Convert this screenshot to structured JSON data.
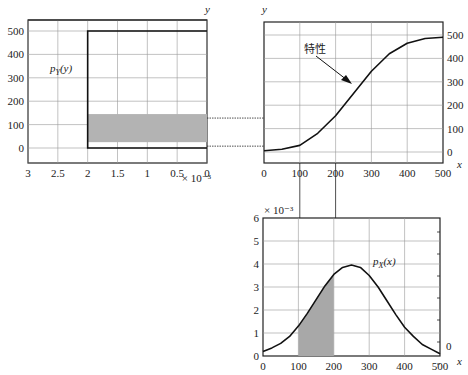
{
  "chart_data": [
    {
      "id": "py",
      "type": "area",
      "title": "",
      "label": "p_Y(y)",
      "label_main": "p",
      "label_sub": "Y",
      "label_arg": "(y)",
      "xlabel": "",
      "ylabel": "y",
      "x_ticks": [
        "3",
        "2.5",
        "2",
        "1.5",
        "1",
        "0.5",
        "0"
      ],
      "x_tick_values": [
        3,
        2.5,
        2,
        1.5,
        1,
        0.5,
        0
      ],
      "x_multiplier": "× 10⁻³",
      "y_ticks": [
        "500",
        "400",
        "300",
        "200",
        "100",
        "0"
      ],
      "y_tick_values": [
        500,
        400,
        300,
        200,
        100,
        0
      ],
      "xlim": [
        3,
        0
      ],
      "ylim": [
        -50,
        550
      ],
      "grid": true,
      "series": [
        {
          "name": "p_Y(y)",
          "y": [
            0,
            500
          ],
          "value": 2
        }
      ],
      "shaded": {
        "y_from": 25,
        "y_to": 145,
        "x_from": 2,
        "x_to": 0
      }
    },
    {
      "id": "transfer",
      "type": "line",
      "title": "",
      "annotation": "特性",
      "xlabel": "x",
      "ylabel": "y",
      "x_ticks": [
        "0",
        "100",
        "200",
        "300",
        "400",
        "500"
      ],
      "x_tick_values": [
        0,
        100,
        200,
        300,
        400,
        500
      ],
      "y_ticks": [
        "500",
        "400",
        "300",
        "200",
        "100",
        "0"
      ],
      "y_tick_values": [
        500,
        400,
        300,
        200,
        100,
        0
      ],
      "xlim": [
        0,
        500
      ],
      "ylim": [
        -50,
        550
      ],
      "grid": true,
      "series": [
        {
          "name": "characteristic",
          "x": [
            0,
            50,
            100,
            150,
            200,
            250,
            300,
            350,
            400,
            450,
            500
          ],
          "y": [
            5,
            12,
            28,
            80,
            155,
            250,
            345,
            420,
            465,
            485,
            490
          ]
        }
      ]
    },
    {
      "id": "px",
      "type": "line",
      "title": "",
      "label": "p_X(x)",
      "label_main": "p",
      "label_sub": "X",
      "label_arg": "(x)",
      "xlabel": "x",
      "ylabel": "",
      "y_multiplier": "× 10⁻³",
      "x_ticks": [
        "0",
        "100",
        "200",
        "300",
        "400",
        "500"
      ],
      "x_tick_values": [
        0,
        100,
        200,
        300,
        400,
        500
      ],
      "y_ticks": [
        "6",
        "5",
        "4",
        "3",
        "2",
        "1",
        "0"
      ],
      "y_tick_values": [
        6,
        5,
        4,
        3,
        2,
        1,
        0
      ],
      "right_tick_label": "0",
      "xlim": [
        0,
        500
      ],
      "ylim": [
        0,
        6
      ],
      "grid": true,
      "series": [
        {
          "name": "p_X(x)",
          "x": [
            0,
            25,
            50,
            75,
            100,
            125,
            150,
            175,
            200,
            225,
            250,
            275,
            300,
            325,
            350,
            375,
            400,
            425,
            450,
            475,
            500
          ],
          "y": [
            0.2,
            0.35,
            0.55,
            0.85,
            1.3,
            1.85,
            2.45,
            3.05,
            3.55,
            3.85,
            3.95,
            3.85,
            3.5,
            3.0,
            2.4,
            1.8,
            1.25,
            0.85,
            0.5,
            0.3,
            0.1
          ]
        }
      ],
      "shaded": {
        "x_from": 100,
        "x_to": 200
      }
    }
  ],
  "connectors": {
    "horizontal_y_values": [
      145,
      25
    ],
    "vertical_x_values": [
      100,
      200
    ]
  }
}
